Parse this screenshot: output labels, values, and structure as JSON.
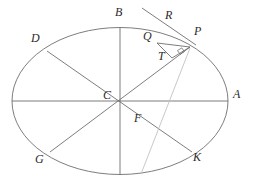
{
  "figure": {
    "type": "geometry-diagram",
    "background_color": "#ffffff",
    "stroke_color": "#6e6e6e",
    "faint_stroke_color": "#b9b9b9",
    "label_color": "#2b2b2b"
  },
  "ellipse": {
    "name": "ellipse",
    "cx": 120,
    "cy": 101,
    "rx": 108,
    "ry": 73.5
  },
  "points": {
    "A": {
      "label": "A",
      "x": 228,
      "y": 101,
      "label_x": 233,
      "label_y": 94
    },
    "B": {
      "label": "B",
      "x": 120,
      "y": 27.5,
      "label_x": 115,
      "label_y": 11
    },
    "C": {
      "label": "C",
      "x": 120,
      "y": 101,
      "label_x": 104,
      "label_y": 95
    },
    "D": {
      "label": "D",
      "x": 47,
      "y": 51,
      "label_x": 32,
      "label_y": 37
    },
    "G": {
      "label": "G",
      "x": 50,
      "y": 152,
      "label_x": 36,
      "label_y": 156
    },
    "K": {
      "label": "K",
      "x": 192,
      "y": 152,
      "label_x": 193,
      "label_y": 154
    },
    "P": {
      "label": "P",
      "x": 190,
      "y": 47,
      "label_x": 195,
      "label_y": 29
    },
    "Q": {
      "label": "Q",
      "x": 157,
      "y": 43,
      "label_x": 144,
      "label_y": 33
    },
    "R": {
      "label": "R",
      "x": 168,
      "y": 31,
      "label_x": 166,
      "label_y": 12
    },
    "T": {
      "label": "T",
      "x": 172,
      "y": 57,
      "label_x": 159,
      "label_y": 51
    },
    "F": {
      "label": "F",
      "x": 150,
      "y": 119,
      "label_x": 135,
      "label_y": 117
    }
  },
  "segments": [
    {
      "name": "diameter-A-C",
      "from": "A",
      "to": "C",
      "style": "solid"
    },
    {
      "name": "diameter-C-left",
      "from": "C",
      "to": "left-vertex",
      "style": "solid"
    },
    {
      "name": "diameter-B-bottom",
      "from": "B",
      "to": "bottom-vertex",
      "style": "solid"
    },
    {
      "name": "diameter-D-K",
      "from": "D",
      "to": "K",
      "style": "solid"
    },
    {
      "name": "diameter-G-P",
      "from": "G",
      "to": "P",
      "style": "solid"
    },
    {
      "name": "tangent-at-P",
      "from": "tangent-start",
      "to": "P",
      "style": "solid"
    },
    {
      "name": "segment-Q-P",
      "from": "Q",
      "to": "P",
      "style": "solid"
    },
    {
      "name": "segment-Q-T",
      "from": "Q",
      "to": "T",
      "style": "solid"
    },
    {
      "name": "segment-T-P",
      "from": "T",
      "to": "P",
      "style": "solid"
    },
    {
      "name": "segment-P-F-faint",
      "from": "P",
      "to": "F-extended",
      "style": "faint"
    }
  ],
  "markers": {
    "right_angle_at_T": {
      "name": "right-angle-marker",
      "x": 180,
      "y": 48,
      "size": 5
    }
  }
}
